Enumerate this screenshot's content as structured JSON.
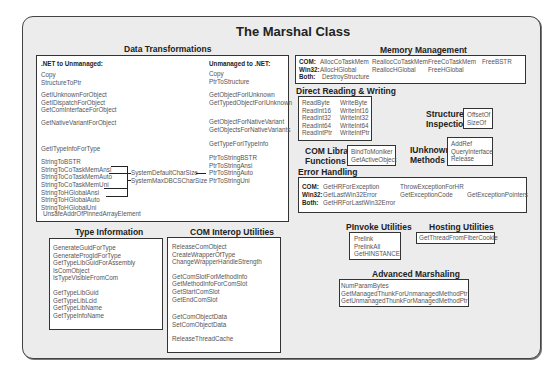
{
  "title": "The Marshal Class",
  "data_transformations": {
    "heading": "Data Transformations",
    "net_to_unmanaged": {
      "label": ".NET to Unmanaged:",
      "groups": [
        [
          "Copy",
          "StructureToPtr"
        ],
        [
          "GetIUnknownForObject",
          "GetIDispatchForObject",
          "GetComInterfaceForObject"
        ],
        [
          "GetNativeVariantForObject"
        ],
        [
          "GetITypeInfoForType"
        ],
        [
          "StringToBSTR",
          "StringToCoTaskMemAnsi",
          "StringToCoTaskMemAuto",
          "StringToCoTaskMemUni",
          "StringToHGlobalAnsi",
          "StringToHGlobalAuto",
          "StringToHGlobalUni"
        ],
        [
          "UnsafeAddrOfPinnedArrayElement"
        ]
      ]
    },
    "char_size": [
      "SystemDefaultCharSize",
      "SystemMaxDBCSCharSize"
    ],
    "unmanaged_to_net": {
      "label": "Unmanaged to .NET:",
      "groups": [
        [
          "Copy",
          "PtrToStructure"
        ],
        [
          "GetObjectForIUnknown",
          "GetTypedObjectForIUnknown"
        ],
        [
          "GetObjectForNativeVariant",
          "GetObjectsForNativeVariants"
        ],
        [
          "GetTypeForITypeInfo"
        ],
        [
          "PtrToStringBSTR",
          "PtrToStringAnsi",
          "PtrToStringAuto",
          "PtrToStringUni"
        ]
      ]
    }
  },
  "type_information": {
    "heading": "Type Information",
    "groups": [
      [
        "GenerateGuidForType",
        "GenerateProgIdForType",
        "GetTypeLibGuidForAssembly",
        "IsComObject",
        "IsTypeVisibleFromCom"
      ],
      [
        "GetTypeLibGuid",
        "GetTypeLibLcid",
        "GetTypeLibName",
        "GetTypeInfoName"
      ]
    ]
  },
  "com_interop": {
    "heading": "COM Interop Utilities",
    "groups": [
      [
        "ReleaseComObject",
        "CreateWrapperOfType",
        "ChangeWrapperHandleStrength"
      ],
      [
        "GetComSlotForMethodInfo",
        "GetMethodInfoForComSlot",
        "GetStartComSlot",
        "GetEndComSlot"
      ],
      [
        "GetComObjectData",
        "SetComObjectData"
      ],
      [
        "ReleaseThreadCache"
      ]
    ]
  },
  "memory_management": {
    "heading": "Memory Management",
    "rows": [
      {
        "label": "COM:",
        "items": [
          "AllocCoTaskMem",
          "ReallocCoTaskMem",
          "FreeCoTaskMem",
          "FreeBSTR"
        ]
      },
      {
        "label": "Win32:",
        "items": [
          "AllocHGlobal",
          "ReallocHGlobal",
          "FreeHGlobal",
          ""
        ]
      },
      {
        "label": "Both:",
        "items": [
          "DestroyStructure",
          "",
          "",
          ""
        ]
      }
    ]
  },
  "direct_rw": {
    "heading": "Direct Reading & Writing",
    "read": [
      "ReadByte",
      "ReadInt16",
      "ReadInt32",
      "ReadInt64",
      "ReadIntPtr"
    ],
    "write": [
      "WriteByte",
      "WriteInt16",
      "WriteInt32",
      "WriteInt64",
      "WriteIntPtr"
    ]
  },
  "structure_inspection": {
    "heading_1": "Structure",
    "heading_2": "Inspection",
    "items": [
      "OffsetOf",
      "SizeOf"
    ]
  },
  "com_library": {
    "heading_1": "COM Library",
    "heading_2": "Functions",
    "items": [
      "BindToMoniker",
      "GetActiveObject"
    ]
  },
  "iunknown": {
    "heading_1": "IUnknown",
    "heading_2": "Methods",
    "items": [
      "AddRef",
      "QueryInterface",
      "Release"
    ]
  },
  "error_handling": {
    "heading": "Error Handling",
    "rows": [
      {
        "label": "COM:",
        "items": [
          "GetHRForException",
          "ThrowExceptionForHR",
          ""
        ]
      },
      {
        "label": "Win32:",
        "items": [
          "GetLastWin32Error",
          "GetExceptionCode",
          "GetExceptionPointers"
        ]
      },
      {
        "label": "Both:",
        "items": [
          "GetHRForLastWin32Error",
          "",
          ""
        ]
      }
    ]
  },
  "pinvoke": {
    "heading": "PInvoke Utilities",
    "items": [
      "Prelink",
      "PrelinkAll",
      "GetHINSTANCE"
    ]
  },
  "hosting": {
    "heading": "Hosting Utilities",
    "items": [
      "GetThreadFromFiberCookie"
    ]
  },
  "advanced": {
    "heading": "Advanced Marshaling",
    "items": [
      "NumParamBytes",
      "GetManagedThunkForUnmanagedMethodPtr",
      "GetUnmanagedThunkForManagedMethodPtr"
    ]
  }
}
